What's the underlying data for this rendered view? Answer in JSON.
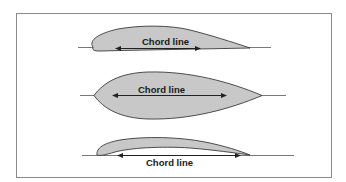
{
  "figure": {
    "frame_color": "#8a8a8a",
    "airfoil_fill": "#c8c8c8",
    "outline_color": "#3a3a3a",
    "line_color": "#555555"
  },
  "airfoils": [
    {
      "id": "cambered-airfoil",
      "label": "Chord line"
    },
    {
      "id": "symmetrical-airfoil",
      "label": "Chord line"
    },
    {
      "id": "thin-cambered-airfoil",
      "label": "Chord line"
    }
  ]
}
